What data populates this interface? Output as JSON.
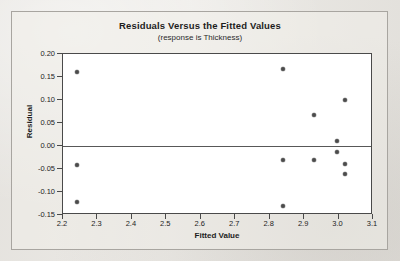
{
  "chart_data": {
    "type": "scatter",
    "title": "Residuals Versus the Fitted Values",
    "subtitle": "(response is Thickness)",
    "xlabel": "Fitted Value",
    "ylabel": "Residual",
    "xlim": [
      2.2,
      3.1
    ],
    "ylim": [
      -0.15,
      0.2
    ],
    "xticks": [
      "2.2",
      "2.3",
      "2.4",
      "2.5",
      "2.6",
      "2.7",
      "2.8",
      "2.9",
      "3.0",
      "3.1"
    ],
    "xtick_values": [
      2.2,
      2.3,
      2.4,
      2.5,
      2.6,
      2.7,
      2.8,
      2.9,
      3.0,
      3.1
    ],
    "yticks": [
      "0.20",
      "0.15",
      "0.10",
      "0.05",
      "0.00",
      "-0.05",
      "-0.10",
      "-0.15"
    ],
    "ytick_values": [
      0.2,
      0.15,
      0.1,
      0.05,
      0.0,
      -0.05,
      -0.1,
      -0.15
    ],
    "grid": false,
    "legend": false,
    "reference_line": 0.0,
    "marker": "filled-circle",
    "marker_color": "#4b4b4b",
    "points": [
      {
        "x": 2.24,
        "y": 0.16
      },
      {
        "x": 2.24,
        "y": -0.041
      },
      {
        "x": 2.24,
        "y": -0.122
      },
      {
        "x": 2.84,
        "y": 0.167
      },
      {
        "x": 2.84,
        "y": -0.031
      },
      {
        "x": 2.84,
        "y": -0.13
      },
      {
        "x": 2.93,
        "y": 0.068
      },
      {
        "x": 2.93,
        "y": -0.031
      },
      {
        "x": 2.995,
        "y": 0.01
      },
      {
        "x": 2.995,
        "y": -0.012
      },
      {
        "x": 3.02,
        "y": 0.101
      },
      {
        "x": 3.02,
        "y": -0.039
      },
      {
        "x": 3.02,
        "y": -0.06
      }
    ]
  },
  "colors": {
    "page_background": "#eceae6",
    "plot_background": "#ffffff",
    "axis": "#4a4a4a",
    "text": "#1d1d1d",
    "marker": "#4b4b4b",
    "zero_line": "#585858",
    "outer_border": "#a8a5a0"
  }
}
